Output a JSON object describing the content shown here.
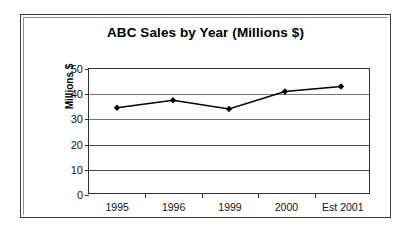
{
  "chart_data": {
    "type": "line",
    "title": "ABC Sales by Year (Millions $)",
    "xlabel": "",
    "ylabel": "Millions $",
    "categories": [
      "1995",
      "1996",
      "1999",
      "2000",
      "Est 2001"
    ],
    "values": [
      34.5,
      37.5,
      34,
      41,
      43
    ],
    "series": [
      {
        "name": "Sales",
        "values": [
          34.5,
          37.5,
          34,
          41,
          43
        ]
      }
    ],
    "ylim": [
      0,
      50
    ],
    "y_ticks": [
      0,
      10,
      20,
      30,
      40,
      50
    ],
    "y_tick_labels": [
      "0",
      "10",
      "20",
      "30",
      "40",
      "50"
    ],
    "grid": true,
    "grid_axis": "y",
    "legend": false,
    "legend_position": "none",
    "marker": "diamond",
    "line_color": "#000000",
    "marker_color": "#000000",
    "plot_background": "#ffffff",
    "annotations": []
  },
  "chart": {
    "title": "ABC Sales by Year (Millions $)",
    "y_axis_title": "Millions $",
    "y_tick_labels": [
      "50",
      "40",
      "30",
      "20",
      "10",
      "0"
    ],
    "x_tick_labels": [
      "1995",
      "1996",
      "1999",
      "2000",
      "Est 2001"
    ]
  }
}
